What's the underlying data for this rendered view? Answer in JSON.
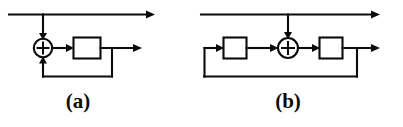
{
  "figure": {
    "background_color": "#ffffff",
    "line_color": "#0b0b0b",
    "width": 403,
    "height": 127
  },
  "diagrams": [
    {
      "id": "a",
      "caption": "(a)",
      "description": "Feedback structure: input splits, lower branch passes through adder then block, block output feeds back to adder",
      "elements": {
        "adder": {
          "name": "summing-junction",
          "symbol": "+",
          "cx": 43,
          "cy": 48,
          "r": 9
        },
        "block": {
          "name": "delay-block",
          "label": "",
          "x": 73,
          "y": 37,
          "width": 28,
          "height": 22
        },
        "input_line": {
          "name": "input-wire",
          "x1": 9,
          "y1": 14,
          "x2": 152,
          "y2": 14
        },
        "branch_tap_x": 43,
        "output_arrow_x": 141,
        "feedback_tap_x": 112,
        "feedback_bottom_y": 77
      }
    },
    {
      "id": "b",
      "caption": "(b)",
      "description": "Feedback structure: first block, adder fed from top branch, second block, output feeds back around to first block input",
      "elements": {
        "adder": {
          "name": "summing-junction",
          "symbol": "+",
          "cx": 288,
          "cy": 48,
          "r": 10
        },
        "block_left": {
          "name": "delay-block-left",
          "label": "",
          "x": 223,
          "y": 37,
          "width": 24,
          "height": 22
        },
        "block_right": {
          "name": "delay-block-right",
          "label": "",
          "x": 319,
          "y": 37,
          "width": 24,
          "height": 22
        },
        "input_line": {
          "name": "input-wire",
          "x1": 200,
          "y1": 14,
          "x2": 378,
          "y2": 14
        },
        "branch_tap_x": 288,
        "output_arrow_x": 378,
        "feedback_tap_x": 357,
        "feedback_bottom_y": 77,
        "feedback_left_x": 204
      }
    }
  ],
  "captions": {
    "a": "(a)",
    "b": "(b)"
  }
}
